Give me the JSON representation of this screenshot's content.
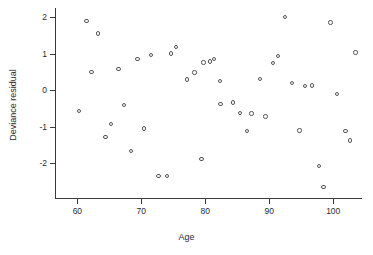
{
  "chart_data": {
    "type": "scatter",
    "title": "",
    "xlabel": "Age",
    "ylabel": "Deviance residual",
    "xlim": [
      56.5,
      104.5
    ],
    "ylim": [
      -2.95,
      2.25
    ],
    "xticks": [
      60,
      70,
      80,
      90,
      100
    ],
    "yticks": [
      -2,
      -1,
      0,
      1,
      2
    ],
    "xtick_labels": [
      "60",
      "70",
      "80",
      "90",
      "100"
    ],
    "ytick_labels": [
      "-2",
      "-1",
      "0",
      "1",
      "2"
    ],
    "grid": false,
    "legend": false,
    "marker": "open-circle",
    "marker_color": "#555555",
    "points": [
      {
        "x": 60.3,
        "y": -0.57
      },
      {
        "x": 61.4,
        "y": 1.9
      },
      {
        "x": 62.2,
        "y": 0.5
      },
      {
        "x": 63.2,
        "y": 1.55
      },
      {
        "x": 64.4,
        "y": -1.28
      },
      {
        "x": 65.3,
        "y": -0.92
      },
      {
        "x": 66.4,
        "y": 0.58
      },
      {
        "x": 67.3,
        "y": -0.41
      },
      {
        "x": 68.4,
        "y": -1.66
      },
      {
        "x": 69.4,
        "y": 0.85
      },
      {
        "x": 70.4,
        "y": -1.05
      },
      {
        "x": 71.5,
        "y": 0.97
      },
      {
        "x": 72.7,
        "y": -2.35
      },
      {
        "x": 74.0,
        "y": -2.34
      },
      {
        "x": 74.6,
        "y": 1.0
      },
      {
        "x": 75.4,
        "y": 1.18
      },
      {
        "x": 77.1,
        "y": 0.29
      },
      {
        "x": 78.3,
        "y": 0.48
      },
      {
        "x": 79.4,
        "y": -1.88
      },
      {
        "x": 79.7,
        "y": 0.76
      },
      {
        "x": 80.7,
        "y": 0.79
      },
      {
        "x": 81.4,
        "y": 0.86
      },
      {
        "x": 82.3,
        "y": 0.25
      },
      {
        "x": 82.4,
        "y": -0.38
      },
      {
        "x": 84.3,
        "y": -0.34
      },
      {
        "x": 85.4,
        "y": -0.63
      },
      {
        "x": 86.5,
        "y": -1.12
      },
      {
        "x": 87.2,
        "y": -0.64
      },
      {
        "x": 88.6,
        "y": 0.31
      },
      {
        "x": 89.4,
        "y": -0.72
      },
      {
        "x": 90.6,
        "y": 0.75
      },
      {
        "x": 91.4,
        "y": 0.94
      },
      {
        "x": 92.5,
        "y": 2.0
      },
      {
        "x": 93.6,
        "y": 0.19
      },
      {
        "x": 94.7,
        "y": -1.1
      },
      {
        "x": 95.6,
        "y": 0.11
      },
      {
        "x": 96.7,
        "y": 0.13
      },
      {
        "x": 97.8,
        "y": -2.08
      },
      {
        "x": 98.5,
        "y": -2.65
      },
      {
        "x": 99.6,
        "y": 1.85
      },
      {
        "x": 100.6,
        "y": -0.11
      },
      {
        "x": 101.9,
        "y": -1.12
      },
      {
        "x": 102.6,
        "y": -1.38
      },
      {
        "x": 103.5,
        "y": 1.03
      }
    ]
  }
}
